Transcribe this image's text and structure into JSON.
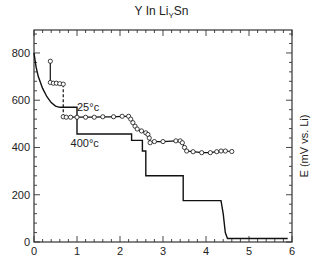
{
  "chart_data": {
    "type": "line",
    "title_parts": {
      "main": "Y In Li",
      "sub": "Y",
      "tail": "Sn"
    },
    "xlabel": "",
    "ylabel": "E (mV vs. Li)",
    "xlim": [
      0,
      6
    ],
    "ylim": [
      0,
      900
    ],
    "x_ticks": [
      0,
      1,
      2,
      3,
      4,
      5,
      6
    ],
    "y_ticks": [
      0,
      200,
      400,
      600,
      800
    ],
    "grid": false,
    "annotations": [
      {
        "text": "25°c",
        "x": 1.0,
        "y": 555
      },
      {
        "text": "400°c",
        "x": 0.85,
        "y": 400
      }
    ],
    "series": [
      {
        "name": "400°c",
        "style": "solid",
        "markers": false,
        "points": [
          [
            0,
            800
          ],
          [
            0.05,
            740
          ],
          [
            0.1,
            700
          ],
          [
            0.2,
            650
          ],
          [
            0.3,
            615
          ],
          [
            0.4,
            590
          ],
          [
            0.5,
            575
          ],
          [
            0.6,
            570
          ],
          [
            1.0,
            570
          ],
          [
            1.0,
            457
          ],
          [
            2.27,
            457
          ],
          [
            2.27,
            430
          ],
          [
            2.52,
            430
          ],
          [
            2.52,
            385
          ],
          [
            2.6,
            385
          ],
          [
            2.6,
            280
          ],
          [
            3.47,
            280
          ],
          [
            3.47,
            175
          ],
          [
            4.35,
            175
          ],
          [
            4.4,
            120
          ],
          [
            4.45,
            40
          ],
          [
            4.5,
            15
          ],
          [
            5.9,
            15
          ]
        ]
      },
      {
        "name": "25°c",
        "style": "solid",
        "markers": true,
        "points": [
          [
            0.37,
            770
          ],
          [
            0.38,
            765
          ],
          [
            0.38,
            675
          ],
          [
            0.45,
            672
          ],
          [
            0.52,
            672
          ],
          [
            0.6,
            670
          ],
          [
            0.68,
            668
          ],
          [
            0.68,
            530
          ],
          [
            0.75,
            528
          ],
          [
            0.85,
            528
          ],
          [
            1.0,
            528
          ],
          [
            1.2,
            528
          ],
          [
            1.4,
            528
          ],
          [
            1.6,
            530
          ],
          [
            1.85,
            530
          ],
          [
            2.05,
            532
          ],
          [
            2.2,
            532
          ],
          [
            2.25,
            520
          ],
          [
            2.3,
            505
          ],
          [
            2.35,
            490
          ],
          [
            2.4,
            478
          ],
          [
            2.5,
            470
          ],
          [
            2.6,
            462
          ],
          [
            2.65,
            455
          ],
          [
            2.68,
            440
          ],
          [
            2.7,
            420
          ],
          [
            2.8,
            425
          ],
          [
            3.0,
            425
          ],
          [
            3.3,
            428
          ],
          [
            3.4,
            428
          ],
          [
            3.45,
            420
          ],
          [
            3.5,
            400
          ],
          [
            3.55,
            385
          ],
          [
            3.7,
            382
          ],
          [
            3.9,
            378
          ],
          [
            4.1,
            378
          ],
          [
            4.25,
            382
          ],
          [
            4.35,
            385
          ],
          [
            4.45,
            385
          ],
          [
            4.6,
            383
          ]
        ],
        "dashed_segment": [
          [
            0.68,
            668
          ],
          [
            0.68,
            530
          ]
        ]
      }
    ]
  }
}
